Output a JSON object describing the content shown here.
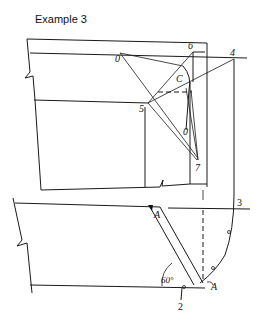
{
  "title": "Example 3",
  "labels": {
    "point_o_top": "0",
    "point_6": "6",
    "point_4": "4",
    "point_c": "C",
    "point_5": "5",
    "point_o_lower": "0",
    "point_7": "7",
    "point_3": "3",
    "point_a_top": "A",
    "point_a_bottom": "A",
    "point_2": "2",
    "angle": "60°"
  }
}
